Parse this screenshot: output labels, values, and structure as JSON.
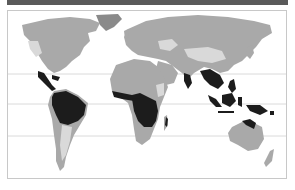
{
  "figure": {
    "type": "world-map",
    "legend_visible": false,
    "text_visible": false
  },
  "colors": {
    "header_bar": "#5a5a5a",
    "frame_border": "#c8c8c8",
    "ocean": "#ffffff",
    "land": "#a9a9a9",
    "land_light": "#d9d9d9",
    "land_dark": "#6e6e6e",
    "rainforest": "#1c1c1c",
    "latitude_lines": "#d0d0d0"
  },
  "reference_lines": [
    {
      "name": "Tropic of Cancer",
      "y": 63
    },
    {
      "name": "Equator",
      "y": 93
    },
    {
      "name": "Tropic of Capricorn",
      "y": 125
    }
  ],
  "highlighted_regions": [
    "Central America",
    "Amazon Basin",
    "West Africa",
    "Congo Basin",
    "Madagascar east coast",
    "India west coast",
    "Southeast Asia",
    "Indonesia",
    "New Guinea",
    "Northeast Australia"
  ]
}
